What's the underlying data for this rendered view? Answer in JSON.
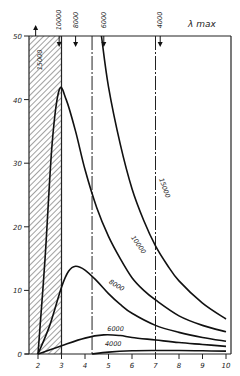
{
  "chart_data": {
    "type": "line",
    "title": "",
    "legend_title": "λ max",
    "xlabel": "",
    "ylabel": "",
    "xlim": [
      1.8,
      10.2
    ],
    "ylim": [
      0,
      50
    ],
    "x_ticks": [
      2,
      3,
      4,
      5,
      6,
      7,
      8,
      9,
      10
    ],
    "y_ticks": [
      0,
      10,
      20,
      30,
      40,
      50
    ],
    "grid": false,
    "shaded_region": {
      "x_from": 1.8,
      "x_to": 3.0,
      "pattern": "diagonal-hatch"
    },
    "vertical_lines": [
      {
        "x": 3.0,
        "style": "solid"
      },
      {
        "x": 4.3,
        "style": "dash-dot"
      },
      {
        "x": 7.0,
        "style": "dash-dot"
      }
    ],
    "lambda_max_markers": [
      {
        "label": "15000",
        "x": 1.9,
        "direction": "up"
      },
      {
        "label": "10000",
        "x": 2.9,
        "direction": "down"
      },
      {
        "label": "8000",
        "x": 3.6,
        "direction": "down"
      },
      {
        "label": "6000",
        "x": 4.8,
        "direction": "down"
      },
      {
        "label": "4000",
        "x": 7.2,
        "direction": "down"
      }
    ],
    "series": [
      {
        "name": "15000",
        "x": [
          4.7,
          5,
          5.5,
          6,
          6.5,
          7,
          7.5,
          8,
          9,
          10
        ],
        "values": [
          50,
          42,
          33,
          26,
          21,
          17,
          14,
          11.5,
          8,
          5.5
        ]
      },
      {
        "name": "10000",
        "x": [
          2,
          2.3,
          2.6,
          2.9,
          3.2,
          3.6,
          4,
          4.5,
          5,
          5.5,
          6,
          6.5,
          7,
          8,
          9,
          10
        ],
        "values": [
          0,
          15,
          33,
          41.5,
          40,
          35,
          29,
          23,
          18.5,
          15,
          12,
          10,
          8.5,
          6,
          4.5,
          3.5
        ]
      },
      {
        "name": "8000",
        "x": [
          2,
          2.5,
          3,
          3.3,
          3.6,
          4,
          4.5,
          5,
          5.5,
          6,
          7,
          8,
          9,
          10
        ],
        "values": [
          0,
          4.5,
          10.5,
          13,
          13.8,
          13.2,
          11.5,
          9.5,
          7.8,
          6.4,
          4.5,
          3.4,
          2.6,
          2
        ]
      },
      {
        "name": "6000",
        "x": [
          2,
          3,
          4,
          4.8,
          5.5,
          6,
          7,
          8,
          9,
          10
        ],
        "values": [
          0,
          1.3,
          2.5,
          3,
          2.9,
          2.6,
          2.2,
          1.8,
          1.5,
          1.2
        ]
      },
      {
        "name": "4000",
        "x": [
          4.3,
          5,
          6,
          7,
          8,
          9,
          10
        ],
        "values": [
          0,
          0.3,
          0.5,
          0.55,
          0.55,
          0.5,
          0.45
        ]
      }
    ],
    "curve_labels": [
      {
        "text": "15000",
        "x": 7.3,
        "y": 26
      },
      {
        "text": "10000",
        "x": 6.2,
        "y": 17
      },
      {
        "text": "8000",
        "x": 5.3,
        "y": 10.5
      },
      {
        "text": "6000",
        "x": 5.3,
        "y": 3.6
      },
      {
        "text": "4000",
        "x": 5.2,
        "y": 1.3
      }
    ]
  }
}
